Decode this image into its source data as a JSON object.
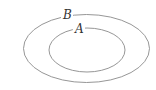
{
  "diagram": {
    "type": "euler",
    "sets": [
      {
        "label": "B",
        "role": "outer",
        "cx": 86.5,
        "cy": 48.5,
        "rx": 63,
        "ry": 34
      },
      {
        "label": "A",
        "role": "inner",
        "cx": 87,
        "cy": 50,
        "rx": 38,
        "ry": 22
      }
    ],
    "stroke_color": "#8a8a8a",
    "label_color": "#333333"
  }
}
